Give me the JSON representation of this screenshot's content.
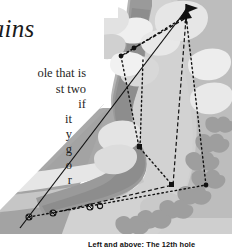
{
  "page": {
    "kind": "scanned-book-page-fragment",
    "background": "#ffffff"
  },
  "article": {
    "heading_line1": "olains",
    "heading_line2": "y",
    "body_lines": [
      "ole that is",
      "st two",
      "if"
    ],
    "body_lines2": [
      "it",
      "y",
      "g",
      "o",
      "r"
    ]
  },
  "caption": {
    "text": "Left and above: The 12th hole"
  },
  "colors": {
    "paper": "#ffffff",
    "rough_light": "#d2d2d2",
    "rough_mid": "#b3b3b3",
    "fairway": "#9a9a9a",
    "fairway_dark": "#8a8a8a",
    "sand": "#f2f2f2",
    "green": "#e3e3e3",
    "trees": "#9c9c9c",
    "ink": "#1a1a1a"
  },
  "diagram": {
    "type": "golf-hole-plan",
    "hole_number": "12",
    "flag": {
      "x": 188,
      "y": 8
    },
    "tee_markers": [
      {
        "x": 29,
        "y": 217
      },
      {
        "x": 53,
        "y": 213
      },
      {
        "x": 90,
        "y": 207
      },
      {
        "x": 100,
        "y": 206
      }
    ],
    "landing_points": [
      {
        "x": 134,
        "y": 48
      },
      {
        "x": 121,
        "y": 56
      },
      {
        "x": 139,
        "y": 147
      },
      {
        "x": 173,
        "y": 185
      },
      {
        "x": 206,
        "y": 185
      },
      {
        "x": 186,
        "y": 10
      }
    ],
    "shot_paths": [
      {
        "name": "solid-drive-line",
        "style": "solid",
        "points": "20,228 186,10"
      },
      {
        "name": "dotted-route-a",
        "style": "dotted",
        "points": "29,217 206,185 186,14 121,56 139,147 173,186"
      },
      {
        "name": "dashed-route-b",
        "style": "dashed",
        "points": "53,213 173,185 186,16 134,48 121,57"
      }
    ]
  }
}
